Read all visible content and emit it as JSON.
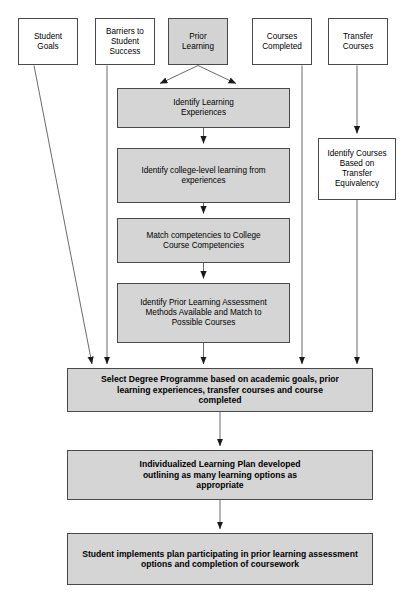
{
  "diagram": {
    "type": "flowchart",
    "title_fragment": "",
    "palette": {
      "shaded_fill": "#d5d5d5",
      "plain_fill": "#ffffff",
      "stroke": "#4a4a4a",
      "text": "#000000"
    },
    "inputs": [
      {
        "id": "student-goals",
        "label": "Student\nGoals",
        "fill": "plain"
      },
      {
        "id": "barriers-to-student-success",
        "label": "Barriers to\nStudent\nSuccess",
        "fill": "plain"
      },
      {
        "id": "prior-learning",
        "label": "Prior\nLearning",
        "fill": "shaded"
      },
      {
        "id": "courses-completed",
        "label": "Courses\nCompleted",
        "fill": "plain"
      },
      {
        "id": "transfer-courses",
        "label": "Transfer\nCourses",
        "fill": "plain"
      }
    ],
    "process_steps": [
      {
        "id": "identify-learning-experiences",
        "label": "Identify Learning\nExperiences"
      },
      {
        "id": "identify-college-level-learning",
        "label": "Identify college-level learning from\nexperiences"
      },
      {
        "id": "match-competencies",
        "label": "Match competencies to College\nCourse Competencies"
      },
      {
        "id": "identify-pla-methods",
        "label": "Identify Prior Learning Assessment\nMethods Available and Match to\nPossible Courses"
      }
    ],
    "side_step": {
      "id": "identify-courses-transfer-equivalency",
      "label": "Identify Courses\nBased on\nTransfer\nEquivalency"
    },
    "outcomes": [
      {
        "id": "select-degree-programme",
        "label": "Select Degree Programme based on academic goals, prior\nlearning experiences, transfer courses and course\ncompleted"
      },
      {
        "id": "individualized-learning-plan",
        "label": "Individualized Learning Plan developed\noutlining as many learning options as\nappropriate"
      },
      {
        "id": "student-implements-plan",
        "label": "Student implements plan participating in prior learning assessment\noptions and completion of coursework"
      }
    ]
  }
}
